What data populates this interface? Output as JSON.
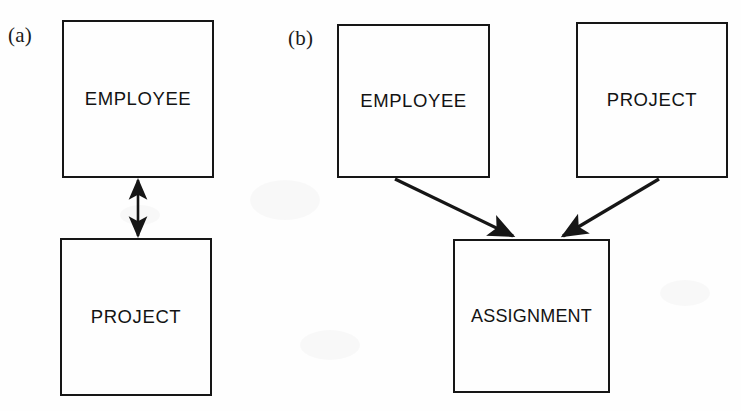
{
  "figure": {
    "type": "entity-relationship-diagram",
    "background_color": "#fefefe",
    "line_color": "#161616",
    "text_color": "#131313"
  },
  "panels": [
    {
      "id": "a",
      "label": "(a)",
      "entities": [
        {
          "name": "employee",
          "label": "EMPLOYEE"
        },
        {
          "name": "project",
          "label": "PROJECT"
        }
      ],
      "connectors": [
        {
          "name": "employee-project-bidirectional",
          "from": "EMPLOYEE",
          "to": "PROJECT",
          "style": "double-headed-arrow"
        }
      ]
    },
    {
      "id": "b",
      "label": "(b)",
      "entities": [
        {
          "name": "employee",
          "label": "EMPLOYEE"
        },
        {
          "name": "project",
          "label": "PROJECT"
        },
        {
          "name": "assignment",
          "label": "ASSIGNMENT"
        }
      ],
      "connectors": [
        {
          "name": "employee-to-assignment",
          "from": "EMPLOYEE",
          "to": "ASSIGNMENT",
          "style": "single-headed-arrow"
        },
        {
          "name": "project-to-assignment",
          "from": "PROJECT",
          "to": "ASSIGNMENT",
          "style": "single-headed-arrow"
        }
      ]
    }
  ]
}
